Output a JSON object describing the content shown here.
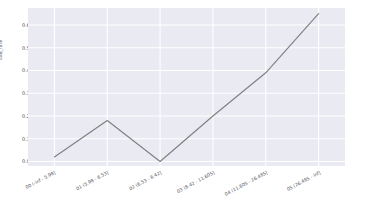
{
  "chart_data": {
    "type": "line",
    "title": "",
    "xlabel": "",
    "ylabel": "bad_rate",
    "categories": [
      "00 (-inf - 5.98]",
      "01 (5.98 - 6.53]",
      "02 (6.53 - 8.42]",
      "03 (8.42 - 11.605]",
      "04 (11.605 - 26.485]",
      "05 (26.485 - inf]"
    ],
    "values": [
      0.02,
      0.18,
      0.0,
      0.2,
      0.39,
      0.65
    ],
    "series": [
      {
        "name": "bad_rate",
        "values": [
          0.02,
          0.18,
          0.0,
          0.2,
          0.39,
          0.65
        ]
      }
    ],
    "ylim": [
      -0.02,
      0.675
    ],
    "yticks": [
      "0.0",
      "0.1",
      "0.2",
      "0.3",
      "0.4",
      "0.5",
      "0.6"
    ],
    "ytick_values": [
      0.0,
      0.1,
      0.2,
      0.3,
      0.4,
      0.5,
      0.6
    ],
    "grid": true,
    "legend": "none",
    "line_color": "#808080",
    "grid_color": "#ffffff",
    "plot_background": "#eaeaf2",
    "figure_background": "#ffffff"
  }
}
